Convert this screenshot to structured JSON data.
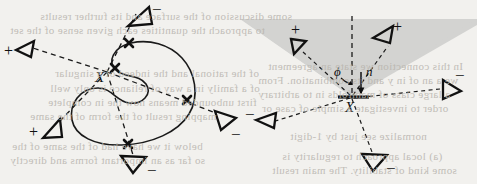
{
  "figure": {
    "caption_absent": true,
    "background_color": "#f2f1ee",
    "ink_color": "#1a1a1a",
    "cone_fill_color": "#d3d3d1",
    "panels": [
      {
        "id": "left-panel",
        "name": "plane-curve-with-normal-rays",
        "center_label": "X",
        "curve_type": "closed-plane-curve-with-inflection",
        "crossing_marks": 4,
        "rays": [
          {
            "name": "ray-upper-left-plus",
            "sign": "+",
            "direction": "upper-left"
          },
          {
            "name": "ray-lower-left-plus",
            "sign": "+",
            "direction": "lower-left"
          },
          {
            "name": "ray-top-minus",
            "sign": "−",
            "direction": "up"
          },
          {
            "name": "ray-right-minus",
            "sign": "−",
            "direction": "right"
          },
          {
            "name": "ray-bottom-minus",
            "sign": "−",
            "direction": "down"
          }
        ]
      },
      {
        "id": "right-panel",
        "name": "tangent-cone-at-point",
        "center_label": "X",
        "angle_label": "ϕ",
        "normal_label": "n",
        "cone_shape": "inverted-triangle",
        "rays": [
          {
            "name": "ray-inside-left-plus",
            "sign": "+",
            "direction": "upper-left"
          },
          {
            "name": "ray-inside-right-plus",
            "sign": "+",
            "direction": "upper-right"
          },
          {
            "name": "ray-outside-left-minus",
            "sign": "−",
            "direction": "lower-left"
          },
          {
            "name": "ray-outside-right-minus",
            "sign": "−",
            "direction": "upper-right-shallow"
          },
          {
            "name": "ray-outside-bottom-minus",
            "sign": "−",
            "direction": "down"
          }
        ]
      }
    ],
    "labels": {
      "X": "X",
      "phi": "ϕ",
      "n": "n",
      "plus": "+",
      "minus": "−"
    },
    "bleed_through_lines": [
      {
        "text": "some discussion of the surface and its further results",
        "x": 40,
        "y": 10
      },
      {
        "text": "to approach the quantities each given sense of the set",
        "x": 10,
        "y": 24
      },
      {
        "text": "of the rational and the indeed of a singular",
        "x": 55,
        "y": 67
      },
      {
        "text": "of a family in a way of reliance is only well",
        "x": 50,
        "y": 82
      },
      {
        "text": "first unbounded means now the in complete",
        "x": 48,
        "y": 96
      },
      {
        "text": "mapping result of the form of the same",
        "x": 30,
        "y": 110
      },
      {
        "text": "below it we have had of the same of the",
        "x": 12,
        "y": 140
      },
      {
        "text": "so far as an important forms and directly",
        "x": 10,
        "y": 154
      },
      {
        "text": "In this connection we state an agreement",
        "x": 268,
        "y": 60
      },
      {
        "text": "we a an of in y and its combination. From",
        "x": 258,
        "y": 74
      },
      {
        "text": "a large class of manifolds in to arbitrary",
        "x": 258,
        "y": 88
      },
      {
        "text": "order to investigate a simple of case or",
        "x": 262,
        "y": 102
      },
      {
        "text": "normalize see just by 1-digit",
        "x": 290,
        "y": 130
      },
      {
        "text": "(a) local approach to regularity is",
        "x": 282,
        "y": 150
      },
      {
        "text": "some kind of stability. The main result",
        "x": 272,
        "y": 164
      }
    ]
  }
}
